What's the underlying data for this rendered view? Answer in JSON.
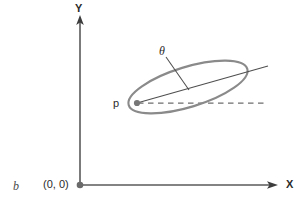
{
  "figure": {
    "label": "b",
    "background_color": "#ffffff",
    "axis_color": "#555555",
    "shape_color": "#8a8a8a",
    "text_color": "#2b2b2b",
    "dash_color": "#6e6e6e"
  },
  "axes": {
    "y_label": "Y",
    "x_label": "X",
    "origin_label": "(0, 0)",
    "origin_x": 80,
    "origin_y": 185,
    "y_top": 17,
    "x_right": 277
  },
  "annotations": {
    "point_label": "p",
    "angle_label": "θ"
  },
  "chart_data": {
    "type": "scatter",
    "title": "",
    "xlabel": "X",
    "ylabel": "Y",
    "ellipse": {
      "center_x": 188,
      "center_y": 87,
      "semi_major": 62,
      "semi_minor": 20,
      "rotation_deg": -17
    },
    "point_p": {
      "x": 137,
      "y": 103
    },
    "major_axis_ray": {
      "x1": 137,
      "y1": 103,
      "x2": 268,
      "y2": 66
    },
    "dashed_reference": {
      "x1": 138,
      "y1": 103,
      "x2": 268,
      "y2": 103
    },
    "angle_leader": {
      "x1": 166,
      "y1": 57,
      "x2": 189,
      "y2": 90
    }
  }
}
